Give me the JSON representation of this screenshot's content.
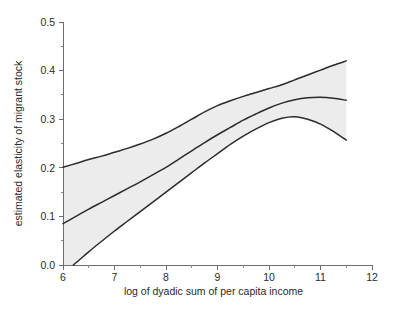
{
  "chart_data": {
    "type": "line",
    "title": "",
    "subtitle": "",
    "xlabel": "log of dyadic sum of per capita income",
    "ylabel": "estimated elasticity of migrant stock",
    "xlim": [
      6,
      12
    ],
    "ylim": [
      0.0,
      0.5
    ],
    "xticks": [
      6,
      7,
      8,
      9,
      10,
      11,
      12
    ],
    "xticklabels": [
      "6",
      "7",
      "8",
      "9",
      "10",
      "11",
      "12"
    ],
    "yticks": [
      0.0,
      0.1,
      0.2,
      0.3,
      0.4,
      0.5
    ],
    "yticklabels": [
      "0.0",
      "0.1",
      "0.2",
      "0.3",
      "0.4",
      "0.5"
    ],
    "minor_xticks": [
      6.5,
      7.5,
      8.5,
      9.5,
      10.5,
      11.5
    ],
    "minor_yticks": [
      0.05,
      0.15,
      0.25,
      0.35,
      0.45
    ],
    "grid": false,
    "legend": "none",
    "annotations": [],
    "band_color": "#ececec",
    "line_color": "#2b2b2b",
    "axis_color": "#6e6e6e",
    "series": [
      {
        "name": "upper confidence bound",
        "x": [
          6.0,
          6.25,
          6.5,
          6.75,
          7.0,
          7.25,
          7.5,
          7.75,
          8.0,
          8.25,
          8.5,
          8.75,
          9.0,
          9.25,
          9.5,
          9.75,
          10.0,
          10.25,
          10.5,
          10.75,
          11.0,
          11.25,
          11.5
        ],
        "values": [
          0.201,
          0.209,
          0.217,
          0.224,
          0.232,
          0.24,
          0.249,
          0.259,
          0.271,
          0.285,
          0.3,
          0.315,
          0.328,
          0.338,
          0.347,
          0.355,
          0.363,
          0.371,
          0.381,
          0.391,
          0.401,
          0.411,
          0.42
        ]
      },
      {
        "name": "estimated elasticity (mean)",
        "x": [
          6.0,
          6.25,
          6.5,
          6.75,
          7.0,
          7.25,
          7.5,
          7.75,
          8.0,
          8.25,
          8.5,
          8.75,
          9.0,
          9.25,
          9.5,
          9.75,
          10.0,
          10.25,
          10.5,
          10.75,
          11.0,
          11.25,
          11.5
        ],
        "values": [
          0.085,
          0.1,
          0.115,
          0.129,
          0.143,
          0.157,
          0.171,
          0.186,
          0.201,
          0.218,
          0.235,
          0.252,
          0.268,
          0.283,
          0.298,
          0.311,
          0.323,
          0.333,
          0.34,
          0.344,
          0.345,
          0.343,
          0.339
        ]
      },
      {
        "name": "lower confidence bound",
        "x": [
          6.2,
          6.4,
          6.6,
          6.8,
          7.0,
          7.25,
          7.5,
          7.75,
          8.0,
          8.25,
          8.5,
          8.75,
          9.0,
          9.25,
          9.5,
          9.75,
          10.0,
          10.25,
          10.5,
          10.75,
          11.0,
          11.25,
          11.5
        ],
        "values": [
          0.0,
          0.018,
          0.036,
          0.053,
          0.07,
          0.09,
          0.11,
          0.13,
          0.15,
          0.17,
          0.19,
          0.21,
          0.229,
          0.248,
          0.265,
          0.28,
          0.293,
          0.302,
          0.305,
          0.3,
          0.29,
          0.275,
          0.257
        ]
      }
    ]
  }
}
